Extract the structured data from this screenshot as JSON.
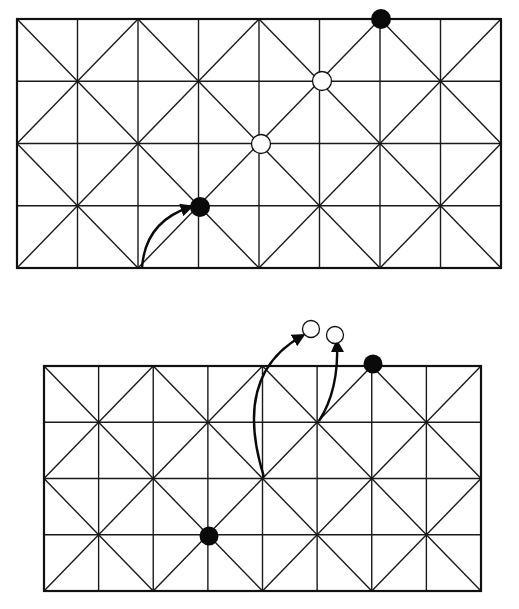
{
  "figure": {
    "colors": {
      "line": "#1a1a1a",
      "black_stone": "#0a0a0a",
      "white_stone": "#ffffff",
      "background": "#ffffff"
    }
  },
  "boards": [
    {
      "id": "top-board",
      "cols": 8,
      "rows": 4,
      "bounds": {
        "x0": 17,
        "y0": 19,
        "x1": 501,
        "y1": 268
      },
      "stones": [
        {
          "color": "black",
          "x": 200,
          "y": 207,
          "r": 10
        },
        {
          "color": "white",
          "x": 261,
          "y": 144,
          "r": 9.5
        },
        {
          "color": "white",
          "x": 322,
          "y": 81,
          "r": 9.5
        },
        {
          "color": "black",
          "x": 381,
          "y": 19,
          "r": 10
        }
      ],
      "arrows": [
        {
          "from": [
            142,
            268
          ],
          "ctrl": [
            145,
            222
          ],
          "to": [
            190,
            207
          ]
        }
      ]
    },
    {
      "id": "bottom-board",
      "cols": 8,
      "rows": 4,
      "bounds": {
        "x0": 44,
        "y0": 366,
        "x1": 481,
        "y1": 591
      },
      "stones": [
        {
          "color": "black",
          "x": 209,
          "y": 536,
          "r": 9.5
        },
        {
          "color": "black",
          "x": 373,
          "y": 364,
          "r": 9.5
        },
        {
          "color": "white",
          "x": 311,
          "y": 329,
          "r": 8.5
        },
        {
          "color": "white",
          "x": 335,
          "y": 335,
          "r": 8.5
        }
      ],
      "arrows": [
        {
          "from": [
            264,
            477
          ],
          "ctrl": [
            232,
            375
          ],
          "to": [
            302,
            336
          ]
        },
        {
          "from": [
            319,
            421
          ],
          "ctrl": [
            339,
            390
          ],
          "to": [
            337,
            343
          ]
        }
      ]
    }
  ]
}
